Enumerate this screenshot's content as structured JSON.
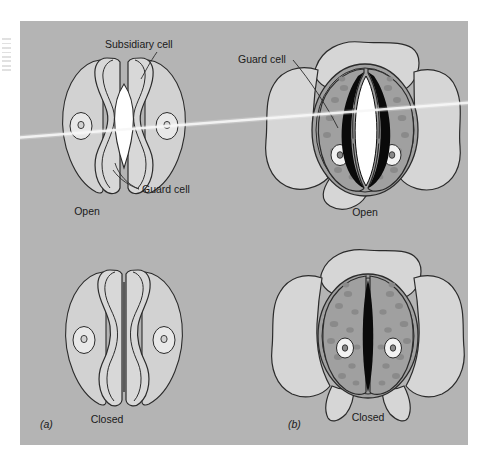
{
  "figure": {
    "kind": "biology-diagram",
    "background_color": "#b4b4b4",
    "page_color": "#ffffff",
    "ink_color": "#2b2b2b",
    "panels": [
      {
        "id": "a",
        "panel_label": "(a)",
        "type": "grass-type-dumbbell-stoma",
        "states": [
          {
            "id": "a-open",
            "state_label": "Open"
          },
          {
            "id": "a-closed",
            "state_label": "Closed"
          }
        ]
      },
      {
        "id": "b",
        "panel_label": "(b)",
        "type": "kidney-type-stoma",
        "states": [
          {
            "id": "b-open",
            "state_label": "Open"
          },
          {
            "id": "b-closed",
            "state_label": "Closed"
          }
        ]
      }
    ],
    "callouts": [
      {
        "id": "subsidiary-cell",
        "text": "Subsidiary cell",
        "panel": "a"
      },
      {
        "id": "guard-cell-a",
        "text": "Guard cell",
        "panel": "a"
      },
      {
        "id": "guard-cell-b",
        "text": "Guard cell",
        "panel": "b"
      }
    ],
    "cell_fills": {
      "subsidiary_cell": "#d2d2d2",
      "guard_cell_grass": "#d8d8d8",
      "guard_cell_kidney": "#a0a0a0",
      "epidermal_cell": "#d6d6d6",
      "chloroplast": "#8a8a8a",
      "nucleus": "#f2f2f2",
      "pore_open": "#ffffff",
      "pore_closed": "#0a0a0a"
    }
  }
}
